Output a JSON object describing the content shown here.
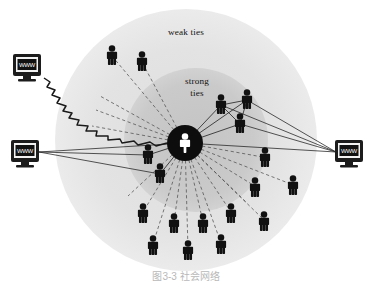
{
  "figure": {
    "type": "social-network-diagram",
    "background_color": "#ffffff",
    "caption": "图3-3 社会网络",
    "labels": {
      "weak_ties": "weak ties",
      "strong_ties_line1": "strong",
      "strong_ties_line2": "ties"
    },
    "colors": {
      "outer_ring": "#e4e4e4",
      "inner_ring": "#c9c9c9",
      "hub_fill": "#0d0d0d",
      "hub_person": "#ffffff",
      "person": "#111111",
      "solid_tie": "#2a2a2a",
      "dashed_tie": "#4a4a4a",
      "zigzag": "#1a1a1a",
      "monitor_body": "#1c1c1c",
      "monitor_screen": "#111111",
      "monitor_text": "#ffffff",
      "caption_text": "#b8b8b8"
    },
    "zones": {
      "outer_circle": {
        "cx": 186,
        "cy": 140,
        "r": 131,
        "label": "weak ties"
      },
      "inner_circle": {
        "cx": 196,
        "cy": 140,
        "r": 72,
        "label": "strong ties"
      }
    },
    "hub": {
      "cx": 185,
      "cy": 143,
      "r": 18,
      "label": "ego"
    },
    "label_positions": {
      "weak_ties": {
        "x": 186,
        "y": 35
      },
      "strong_ties_line1": {
        "x": 197,
        "y": 84
      },
      "strong_ties_line2": {
        "x": 197,
        "y": 96
      }
    },
    "caption_position": {
      "x": 186,
      "y": 279
    },
    "monitors": [
      {
        "name": "monitor-top-left",
        "x": 13,
        "y": 54,
        "w": 28,
        "h": 26,
        "screen_text": "WWW",
        "link": "zigzag"
      },
      {
        "name": "monitor-mid-left",
        "x": 11,
        "y": 140,
        "w": 28,
        "h": 26,
        "screen_text": "WWW",
        "link": "solid-fan"
      },
      {
        "name": "monitor-right",
        "x": 335,
        "y": 140,
        "w": 28,
        "h": 26,
        "screen_text": "WWW",
        "link": "solid-fan"
      }
    ],
    "zigzag_path": "M 44,78 L 50,82 L 47,87 L 55,90 L 52,95 L 60,98 L 57,103 L 66,106 L 63,111 L 72,113 L 69,118 L 79,120 L 77,125 L 88,126 L 86,131 L 97,131 L 96,136 L 108,136 L 108,140 L 120,139 L 122,143 L 134,141 L 138,145 L 150,142 L 156,146 L 167,143",
    "strong_tie_people": [
      {
        "id": "s1",
        "x": 221,
        "y": 105,
        "connected": true
      },
      {
        "id": "s2",
        "x": 247,
        "y": 100,
        "connected": true
      },
      {
        "id": "s3",
        "x": 240,
        "y": 124,
        "connected": true
      },
      {
        "id": "s4",
        "x": 148,
        "y": 155,
        "connected": true
      },
      {
        "id": "s5",
        "x": 160,
        "y": 174,
        "connected": true
      }
    ],
    "weak_tie_people": [
      {
        "id": "w1",
        "x": 112,
        "y": 56
      },
      {
        "id": "w2",
        "x": 142,
        "y": 62
      },
      {
        "id": "w3",
        "x": 265,
        "y": 158
      },
      {
        "id": "w4",
        "x": 255,
        "y": 188
      },
      {
        "id": "w5",
        "x": 293,
        "y": 186
      },
      {
        "id": "w6",
        "x": 143,
        "y": 214
      },
      {
        "id": "w7",
        "x": 174,
        "y": 224
      },
      {
        "id": "w8",
        "x": 203,
        "y": 224
      },
      {
        "id": "w9",
        "x": 231,
        "y": 214
      },
      {
        "id": "w10",
        "x": 264,
        "y": 222
      },
      {
        "id": "w11",
        "x": 153,
        "y": 246
      },
      {
        "id": "w12",
        "x": 188,
        "y": 251
      },
      {
        "id": "w13",
        "x": 221,
        "y": 245
      }
    ],
    "solid_ties_from_monitors": {
      "mid_left_targets": [
        [
          185,
          143
        ],
        [
          148,
          155
        ],
        [
          160,
          174
        ]
      ],
      "right_targets": [
        [
          185,
          143
        ],
        [
          221,
          105
        ],
        [
          240,
          124
        ],
        [
          247,
          100
        ]
      ]
    },
    "dashed_fan_count": 18,
    "legend": {
      "solid_line_meaning": "strong tie",
      "dashed_line_meaning": "weak tie",
      "zigzag_meaning": "internet link"
    }
  }
}
